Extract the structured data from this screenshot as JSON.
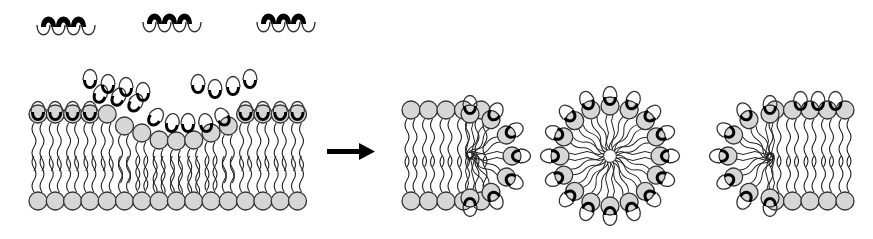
{
  "figure": {
    "colors": {
      "background": "#ffffff",
      "lipid_head_fill": "#d6d6d6",
      "outline": "#333333",
      "peptide_hydrophobic": "#000000",
      "peptide_hydrophilic": "#ffffff",
      "arrow": "#000000"
    },
    "panels": [
      {
        "id": "free-peptides",
        "label": "Free peptides in solution",
        "peptide_count": 3
      },
      {
        "id": "bilayer-binding",
        "label": "Peptides adsorbing to and inserting into lipid bilayer",
        "top_leaflet_lipids": 16,
        "bottom_leaflet_lipids": 16
      },
      {
        "id": "transition-arrow",
        "label": "arrow"
      },
      {
        "id": "left-pore-edge",
        "label": "Bilayer edge capped by peptides (left fragment)"
      },
      {
        "id": "micelle",
        "label": "Peptide-lipid mixed micelle"
      },
      {
        "id": "right-pore-edge",
        "label": "Bilayer edge capped by peptides (right fragment)"
      }
    ]
  }
}
